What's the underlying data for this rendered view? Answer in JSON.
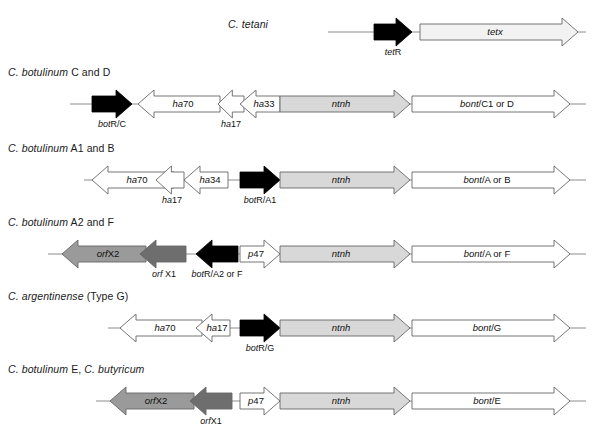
{
  "figure": {
    "title_partial": "",
    "background": "#ffffff",
    "stroke": "#555555",
    "text_color": "#111111"
  },
  "palette": {
    "black": "#000000",
    "white": "#ffffff",
    "light_gray": "#d8d8d8",
    "mid_gray": "#9a9a9a",
    "dark_gray": "#6e6e6e",
    "very_light": "#f2f2f2",
    "outline": "#666666",
    "baseline": "#8c8c8c"
  },
  "rows": [
    {
      "id": "c-tetani",
      "organism_italic": "C. tetani",
      "organism_plain": "",
      "label_x": 228,
      "label_y": 28,
      "label_align": "left",
      "baseline_y": 32,
      "line_start": 328,
      "line_end": 586,
      "genes": [
        {
          "name": "tetR",
          "italic_part": "tet",
          "plain_part": "R",
          "x": 374,
          "w": 38,
          "dir": "right",
          "fill": "black",
          "label_pos": "below",
          "label_x": 393,
          "label_y": 55,
          "shape": "arrow"
        },
        {
          "name": "tetx",
          "italic_part": "tetx",
          "plain_part": "",
          "x": 420,
          "w": 158,
          "dir": "right",
          "fill": "very_light",
          "label_pos": "inside",
          "shape": "arrow"
        }
      ]
    },
    {
      "id": "c-botulinum-c-d",
      "organism_italic": "C. botulinum",
      "organism_plain": " C and D",
      "label_x": 8,
      "label_y": 76,
      "label_align": "left",
      "baseline_y": 104,
      "line_start": 70,
      "line_end": 586,
      "genes": [
        {
          "name": "botR/C",
          "italic_part": "bot",
          "plain_part": "R/C",
          "x": 92,
          "w": 40,
          "dir": "right",
          "fill": "black",
          "label_pos": "below",
          "label_x": 112,
          "label_y": 127,
          "shape": "arrow"
        },
        {
          "name": "ha70",
          "italic_part": "ha",
          "plain_part": "70",
          "x": 138,
          "w": 82,
          "dir": "left",
          "fill": "white",
          "label_pos": "inside",
          "shape": "arrow"
        },
        {
          "name": "ha17",
          "italic_part": "ha",
          "plain_part": "17",
          "x": 218,
          "w": 26,
          "dir": "left",
          "fill": "white",
          "label_pos": "below",
          "label_x": 231,
          "label_y": 127,
          "shape": "arrow"
        },
        {
          "name": "ha33",
          "italic_part": "ha",
          "plain_part": "33",
          "x": 240,
          "w": 40,
          "dir": "left",
          "fill": "white",
          "label_pos": "inside",
          "shape": "arrow"
        },
        {
          "name": "ntnh",
          "italic_part": "ntnh",
          "plain_part": "",
          "x": 280,
          "w": 130,
          "dir": "right",
          "fill": "light_gray",
          "label_pos": "inside",
          "shape": "arrow"
        },
        {
          "name": "bont/C1 or D",
          "italic_part": "bont",
          "plain_part": "/C1 or D",
          "x": 412,
          "w": 158,
          "dir": "right",
          "fill": "white",
          "label_pos": "inside",
          "shape": "arrow"
        }
      ]
    },
    {
      "id": "c-botulinum-a1-b",
      "organism_italic": "C. botulinum",
      "organism_plain": " A1 and B",
      "label_x": 8,
      "label_y": 152,
      "label_align": "left",
      "baseline_y": 180,
      "line_start": 84,
      "line_end": 586,
      "genes": [
        {
          "name": "ha70",
          "italic_part": "ha",
          "plain_part": "70",
          "x": 92,
          "w": 82,
          "dir": "left",
          "fill": "white",
          "label_pos": "inside",
          "shape": "arrow"
        },
        {
          "name": "ha17",
          "italic_part": "ha",
          "plain_part": "17",
          "x": 156,
          "w": 28,
          "dir": "left",
          "fill": "white",
          "label_pos": "below",
          "label_x": 172,
          "label_y": 203,
          "shape": "arrow"
        },
        {
          "name": "ha34",
          "italic_part": "ha",
          "plain_part": "34",
          "x": 184,
          "w": 44,
          "dir": "left",
          "fill": "white",
          "label_pos": "inside",
          "shape": "arrow"
        },
        {
          "name": "botR/A1",
          "italic_part": "bot",
          "plain_part": "R/A1",
          "x": 240,
          "w": 40,
          "dir": "right",
          "fill": "black",
          "label_pos": "below",
          "label_x": 260,
          "label_y": 203,
          "shape": "arrow"
        },
        {
          "name": "ntnh",
          "italic_part": "ntnh",
          "plain_part": "",
          "x": 280,
          "w": 130,
          "dir": "right",
          "fill": "light_gray",
          "label_pos": "inside",
          "shape": "arrow"
        },
        {
          "name": "bont/A or B",
          "italic_part": "bont",
          "plain_part": "/A or B",
          "x": 412,
          "w": 158,
          "dir": "right",
          "fill": "white",
          "label_pos": "inside",
          "shape": "arrow"
        }
      ]
    },
    {
      "id": "c-botulinum-a2-f",
      "organism_italic": "C. botulinum",
      "organism_plain": " A2 and F",
      "label_x": 8,
      "label_y": 226,
      "label_align": "left",
      "baseline_y": 254,
      "line_start": 48,
      "line_end": 586,
      "genes": [
        {
          "name": "orfX2",
          "italic_part": "orf",
          "plain_part": "X2",
          "x": 62,
          "w": 84,
          "dir": "left",
          "fill": "mid_gray",
          "label_pos": "inside",
          "shape": "arrow"
        },
        {
          "name": "orfX1",
          "italic_part": "orf",
          "plain_part": " X1",
          "x": 140,
          "w": 46,
          "dir": "left",
          "fill": "dark_gray",
          "label_pos": "below",
          "label_x": 164,
          "label_y": 277,
          "shape": "arrow"
        },
        {
          "name": "botR/A2 or F",
          "italic_part": "bot",
          "plain_part": "R/A2 or F",
          "x": 196,
          "w": 42,
          "dir": "left",
          "fill": "black",
          "label_pos": "below",
          "label_x": 217,
          "label_y": 277,
          "shape": "arrow"
        },
        {
          "name": "p47",
          "italic_part": "p",
          "plain_part": "47",
          "x": 240,
          "w": 40,
          "dir": "right",
          "fill": "white",
          "label_pos": "inside",
          "shape": "arrow"
        },
        {
          "name": "ntnh",
          "italic_part": "ntnh",
          "plain_part": "",
          "x": 280,
          "w": 130,
          "dir": "right",
          "fill": "light_gray",
          "label_pos": "inside",
          "shape": "arrow"
        },
        {
          "name": "bont/A or F",
          "italic_part": "bont",
          "plain_part": "/A or F",
          "x": 412,
          "w": 158,
          "dir": "right",
          "fill": "white",
          "label_pos": "inside",
          "shape": "arrow"
        }
      ]
    },
    {
      "id": "c-argentinense-g",
      "organism_italic": "C. argentinense",
      "organism_plain": " (Type G)",
      "label_x": 8,
      "label_y": 300,
      "label_align": "left",
      "baseline_y": 328,
      "line_start": 108,
      "line_end": 586,
      "genes": [
        {
          "name": "ha70",
          "italic_part": "ha",
          "plain_part": "70",
          "x": 120,
          "w": 82,
          "dir": "left",
          "fill": "white",
          "label_pos": "inside",
          "shape": "arrow"
        },
        {
          "name": "ha17",
          "italic_part": "ha",
          "plain_part": "17",
          "x": 196,
          "w": 34,
          "dir": "left",
          "fill": "white",
          "label_pos": "inside",
          "shape": "arrow"
        },
        {
          "name": "botR/G",
          "italic_part": "bot",
          "plain_part": "R/G",
          "x": 240,
          "w": 40,
          "dir": "right",
          "fill": "black",
          "label_pos": "below",
          "label_x": 260,
          "label_y": 351,
          "shape": "arrow"
        },
        {
          "name": "ntnh",
          "italic_part": "ntnh",
          "plain_part": "",
          "x": 280,
          "w": 130,
          "dir": "right",
          "fill": "light_gray",
          "label_pos": "inside",
          "shape": "arrow"
        },
        {
          "name": "bont/G",
          "italic_part": "bont",
          "plain_part": "/G",
          "x": 412,
          "w": 158,
          "dir": "right",
          "fill": "white",
          "label_pos": "inside",
          "shape": "arrow"
        }
      ]
    },
    {
      "id": "c-botulinum-e-butyricum",
      "organism_italic": "C. botulinum",
      "organism_plain": " E, ",
      "organism_italic2": "C. butyricum",
      "label_x": 8,
      "label_y": 373,
      "label_align": "left",
      "baseline_y": 401,
      "line_start": 96,
      "line_end": 586,
      "genes": [
        {
          "name": "orfX2",
          "italic_part": "orf",
          "plain_part": "X2",
          "x": 110,
          "w": 84,
          "dir": "left",
          "fill": "mid_gray",
          "label_pos": "inside",
          "shape": "arrow"
        },
        {
          "name": "orfX1",
          "italic_part": "orf",
          "plain_part": "X1",
          "x": 190,
          "w": 42,
          "dir": "left",
          "fill": "dark_gray",
          "label_pos": "below",
          "label_x": 211,
          "label_y": 424,
          "shape": "arrow"
        },
        {
          "name": "p47",
          "italic_part": "p",
          "plain_part": "47",
          "x": 240,
          "w": 40,
          "dir": "right",
          "fill": "white",
          "label_pos": "inside",
          "shape": "arrow"
        },
        {
          "name": "ntnh",
          "italic_part": "ntnh",
          "plain_part": "",
          "x": 280,
          "w": 130,
          "dir": "right",
          "fill": "light_gray",
          "label_pos": "inside",
          "shape": "arrow"
        },
        {
          "name": "bont/E",
          "italic_part": "bont",
          "plain_part": "/E",
          "x": 412,
          "w": 158,
          "dir": "right",
          "fill": "white",
          "label_pos": "inside",
          "shape": "arrow"
        }
      ]
    }
  ]
}
